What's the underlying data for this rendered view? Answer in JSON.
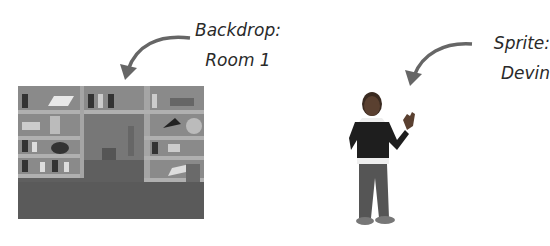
{
  "labels": {
    "backdrop": {
      "line1": "Backdrop:",
      "line2": "Room 1"
    },
    "sprite": {
      "line1": "Sprite:",
      "line2": "Devin"
    }
  },
  "images": {
    "backdrop": "library room with bookshelves, chair and floor",
    "sprite": "boy character in dark sweater waving"
  },
  "colors": {
    "arrow": "#666666",
    "text": "#2a2a2a"
  }
}
